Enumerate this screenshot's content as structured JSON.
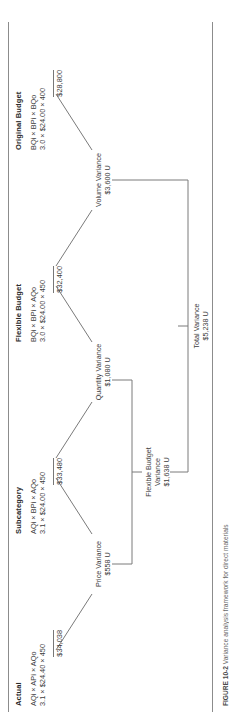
{
  "figure": {
    "caption_label": "FIGURE 10-2",
    "caption_text": "Variance analysis framework for direct materials"
  },
  "columns": [
    {
      "key": "actual",
      "header": "Actual",
      "formula": "AQi × APi × AQo",
      "values": "3.1 × $24.40 × 450",
      "total": "$34,038"
    },
    {
      "key": "subcategory",
      "header": "Subcategory",
      "formula": "AQi × BPi × AQo",
      "values": "3.1 × $24.00 × 450",
      "total": "$33,480"
    },
    {
      "key": "flexible_budget",
      "header": "Flexible Budget",
      "formula": "BQi × BPi × AQo",
      "values": "3.0 × $24.00 × 450",
      "total": "$32,400"
    },
    {
      "key": "original_budget",
      "header": "Original Budget",
      "formula": "BQi × BPi × BQo",
      "values": "3.0 × $24.00 × 400",
      "total": "$28,800"
    }
  ],
  "variances": {
    "price": {
      "label": "Price Variance",
      "amount": "$558 U"
    },
    "quantity": {
      "label": "Quantity Variance",
      "amount": "$1,080 U"
    },
    "volume": {
      "label": "Volume Variance",
      "amount": "$3,600 U"
    },
    "flexible_budget": {
      "label_line1": "Flexible Budget",
      "label_line2": "Variance",
      "amount": "$1,638 U"
    },
    "total": {
      "label": "Total Variance",
      "amount": "$5,238 U"
    }
  },
  "colors": {
    "line": "#7a7a7a",
    "text": "#3d3d3d",
    "header": "#2b2b2b",
    "rule": "#8c8c8c"
  }
}
